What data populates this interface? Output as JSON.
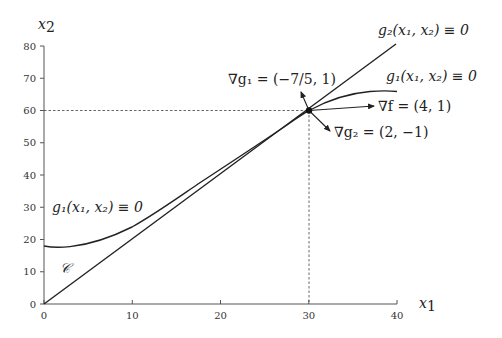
{
  "diagram": {
    "type": "constraint-geometry",
    "axes": {
      "x_label_base": "x",
      "x_label_sub": "1",
      "y_label_base": "x",
      "y_label_sub": "2",
      "x_ticks": [
        "0",
        "10",
        "20",
        "30",
        "40"
      ],
      "y_ticks": [
        "0",
        "10",
        "20",
        "30",
        "40",
        "50",
        "60",
        "70",
        "80"
      ],
      "xlim": [
        0,
        40
      ],
      "ylim": [
        0,
        80
      ]
    },
    "curves": {
      "g2_label": "g₂(x₁, x₂) ≡ 0",
      "g1_label_right": "g₁(x₁, x₂) ≡ 0",
      "g1_label_left": "g₁(x₁, x₂) ≡ 0",
      "feasible_region_label": "𝒞"
    },
    "point": {
      "x": 30,
      "y": 60
    },
    "gradients": {
      "grad_g1": "∇g₁ = (−7/5, 1)",
      "grad_f": "∇f = (4, 1)",
      "grad_g2": "∇g₂ = (2, −1)"
    },
    "colors": {
      "line": "#222222",
      "axis": "#555555",
      "guide": "#555555"
    }
  }
}
